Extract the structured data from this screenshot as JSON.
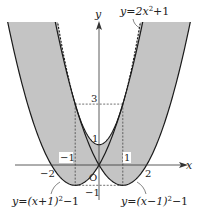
{
  "diagram": {
    "type": "function-plot",
    "origin_label": "O",
    "axes": {
      "x_label": "x",
      "y_label": "y",
      "x_ticks": [
        "-2",
        "-1",
        "1",
        "2"
      ],
      "y_ticks": [
        "3",
        "1",
        "-1"
      ]
    },
    "curves": [
      {
        "name": "left-parabola",
        "equation": "y=(x+1)^2-1",
        "label": "y=(x+1)²−1",
        "style": "solid"
      },
      {
        "name": "right-parabola",
        "equation": "y=(x-1)^2-1",
        "label": "y=(x−1)²−1",
        "style": "solid"
      },
      {
        "name": "upper-parabola",
        "equation": "y=2x^2+1",
        "label": "y=2x²+1",
        "style": "dashed"
      }
    ],
    "shaded_region": "min((x+1)^2-1, (x-1)^2-1) ≤ y ≤ 2x^2+1",
    "guide_lines": [
      {
        "from": [
          -1,
          3
        ],
        "to": [
          1,
          3
        ],
        "note": "y=3 tangent points"
      },
      {
        "from": [
          -1,
          3
        ],
        "to": [
          -1,
          -1
        ]
      },
      {
        "from": [
          1,
          3
        ],
        "to": [
          1,
          -1
        ]
      },
      {
        "from": [
          -1,
          -1
        ],
        "to": [
          1,
          -1
        ]
      }
    ],
    "colors": {
      "shade": "#c4c4c4",
      "curve": "#1a1a1a",
      "axis": "#333333"
    }
  },
  "labels": {
    "y_axis": "y",
    "x_axis": "x",
    "origin": "O",
    "tick_neg2": "−2",
    "tick_neg1": "−1",
    "tick_1": "1",
    "tick_2": "2",
    "ytick_3": "3",
    "ytick_1": "1",
    "ytick_neg1": "−1",
    "eq_upper_pre": "y=2x",
    "eq_upper_sup": "2",
    "eq_upper_post": "+1",
    "eq_left_pre": "y=(x+1)",
    "eq_left_sup": "2",
    "eq_left_post": "−1",
    "eq_right_pre": "y=(x−1)",
    "eq_right_sup": "2",
    "eq_right_post": "−1"
  }
}
